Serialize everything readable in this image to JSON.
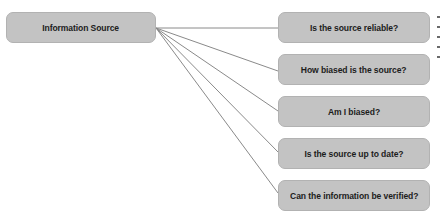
{
  "diagram": {
    "type": "one-to-many connector diagram",
    "source_node": {
      "label": "Information Source"
    },
    "question_nodes": [
      {
        "label": "Is the source reliable?"
      },
      {
        "label": "How biased is the source?"
      },
      {
        "label": "Am I biased?"
      },
      {
        "label": "Is the source up to date?"
      },
      {
        "label": "Can the information be verified?"
      }
    ],
    "edges": [
      {
        "from": "Information Source",
        "to": "Is the source reliable?"
      },
      {
        "from": "Information Source",
        "to": "How biased is the source?"
      },
      {
        "from": "Information Source",
        "to": "Am I biased?"
      },
      {
        "from": "Information Source",
        "to": "Is the source up to date?"
      },
      {
        "from": "Information Source",
        "to": "Can the information be verified?"
      }
    ],
    "colors": {
      "node_fill": "#c3c3c3",
      "node_border": "#b2b2b2",
      "text": "#1c1c1c",
      "connector": "#8a8a8a"
    }
  }
}
